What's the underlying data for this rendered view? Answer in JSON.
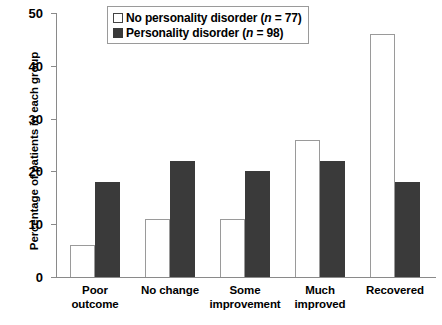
{
  "chart_data": {
    "type": "bar",
    "title": "",
    "xlabel": "",
    "ylabel": "Percentage of patients in each group",
    "ylim": [
      0,
      50
    ],
    "yticks": [
      0,
      10,
      20,
      30,
      40,
      50
    ],
    "grid": false,
    "legend_position": "top-center",
    "categories": [
      "Poor outcome",
      "No change",
      "Some improvement",
      "Much improved",
      "Recovered"
    ],
    "category_lines": [
      [
        "Poor",
        "outcome"
      ],
      [
        "No change",
        ""
      ],
      [
        "Some",
        "improvement"
      ],
      [
        "Much",
        "improved"
      ],
      [
        "Recovered",
        ""
      ]
    ],
    "series": [
      {
        "name": "No personality disorder (n = 77)",
        "name_prefix": "No personality disorder (",
        "name_italic": "n",
        "name_suffix": " = 77)",
        "color": "#ffffff",
        "edge_color": "#9a9a9a",
        "values": [
          6,
          11,
          11,
          26,
          46
        ]
      },
      {
        "name": "Personality disorder (n = 98)",
        "name_prefix": "Personality disorder (",
        "name_italic": "n",
        "name_suffix": " = 98)",
        "color": "#3a3a3a",
        "edge_color": "#3a3a3a",
        "values": [
          18,
          22,
          20,
          22,
          18
        ]
      }
    ]
  }
}
